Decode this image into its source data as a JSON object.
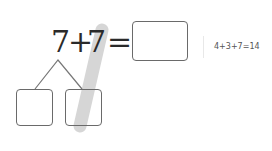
{
  "equation": {
    "addend1": "7",
    "plus": "+",
    "addend2": "7",
    "equals": "="
  },
  "hint": {
    "text": "4+3+7=14"
  },
  "colors": {
    "stroke_highlight": "#d6d6d6",
    "box_border": "#6a6a6a",
    "text": "#2a2a2a"
  }
}
